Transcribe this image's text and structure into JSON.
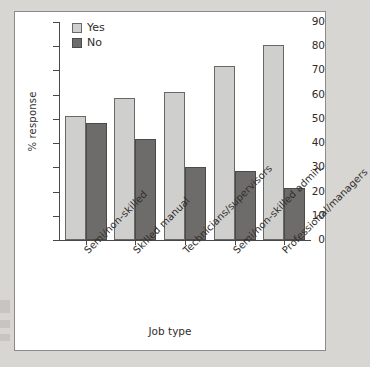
{
  "chart_data": {
    "type": "bar",
    "title": "",
    "xlabel": "Job type",
    "ylabel": "% response",
    "ylim": [
      0,
      90
    ],
    "ytick_labels": [
      "0",
      "10",
      "20",
      "30",
      "40",
      "50",
      "60",
      "70",
      "80",
      "90"
    ],
    "ytick_values": [
      0,
      10,
      20,
      30,
      40,
      50,
      60,
      70,
      80,
      90
    ],
    "grid": false,
    "legend_position": "top-left",
    "categories": [
      "Semi/non-skilled",
      "Skilled manual",
      "Technicians/supervisors",
      "Semi/non-skilled admin.",
      "Professional/managers"
    ],
    "series": [
      {
        "name": "Yes",
        "color": "#cfcfcd",
        "values": [
          51,
          58.5,
          61,
          72,
          80.5
        ]
      },
      {
        "name": "No",
        "color": "#6e6c6a",
        "values": [
          48.5,
          41.5,
          30.3,
          28.5,
          21.5
        ]
      }
    ]
  },
  "legend": {
    "items": [
      {
        "label": "Yes"
      },
      {
        "label": "No"
      }
    ]
  }
}
